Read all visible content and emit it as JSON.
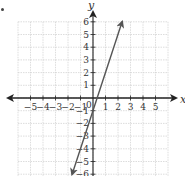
{
  "chart_data": {
    "type": "line",
    "title": "",
    "xlabel": "x",
    "ylabel": "y",
    "xlim": [
      -5,
      5
    ],
    "ylim": [
      -6,
      6
    ],
    "grid": true,
    "x_ticks": [
      "−5",
      "−4",
      "−3",
      "−2",
      "−1",
      "1",
      "2",
      "3",
      "4",
      "5"
    ],
    "y_ticks": [
      "6",
      "5",
      "4",
      "3",
      "2",
      "1",
      "−1",
      "−2",
      "−3",
      "−4",
      "−5",
      "−6"
    ],
    "origin_label": "0",
    "series": [
      {
        "name": "y = 3x − 1",
        "equation": "y = 3x - 1",
        "x": [
          -1.67,
          2.33
        ],
        "y": [
          -6,
          6
        ],
        "arrows": "both",
        "color": "#555555"
      }
    ]
  },
  "labels": {
    "x_axis": "x",
    "y_axis": "y",
    "origin": "0"
  }
}
